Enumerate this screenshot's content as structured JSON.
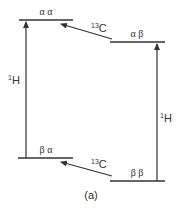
{
  "diagram": {
    "type": "energy-level-diagram",
    "panel_label": "(a)",
    "levels": [
      {
        "id": "aa",
        "label": "α α",
        "x1": 19,
        "x2": 73,
        "y": 20
      },
      {
        "id": "ab",
        "label": "α β",
        "x1": 110,
        "x2": 165,
        "y": 42
      },
      {
        "id": "ba",
        "label": "β α",
        "x1": 18,
        "x2": 73,
        "y": 158
      },
      {
        "id": "bb",
        "label": "β β",
        "x1": 110,
        "x2": 165,
        "y": 181
      }
    ],
    "transitions": [
      {
        "from": "ba",
        "to": "aa",
        "nucleus_mass": "1",
        "nucleus_symbol": "H"
      },
      {
        "from": "bb",
        "to": "ab",
        "nucleus_mass": "1",
        "nucleus_symbol": "H"
      },
      {
        "from": "ab",
        "to": "aa",
        "nucleus_mass": "13",
        "nucleus_symbol": "C"
      },
      {
        "from": "bb",
        "to": "ba",
        "nucleus_mass": "13",
        "nucleus_symbol": "C"
      }
    ]
  }
}
